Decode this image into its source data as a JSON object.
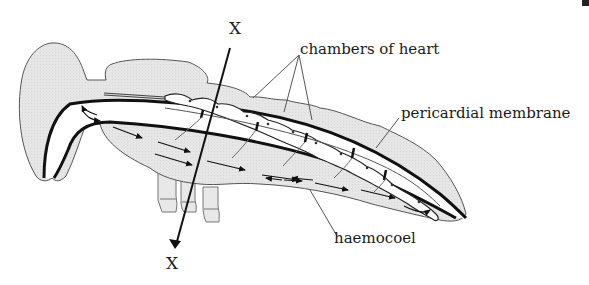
{
  "figure": {
    "type": "anatomical diagram",
    "labels": {
      "chambers": "chambers of heart",
      "pericardial": "pericardial membrane",
      "haemocoel": "haemocoel",
      "x_top": "X",
      "x_bottom": "X"
    },
    "section_line": {
      "name": "X–X",
      "direction": "top to bottom",
      "arrowhead": "bottom"
    },
    "colors": {
      "background": "#ffffff",
      "body_fill": "#e6e6e6",
      "body_outline": "#555555",
      "vessel_stroke": "#111111",
      "heart_channel": "#ffffff",
      "text": "#1a1a1a"
    }
  }
}
